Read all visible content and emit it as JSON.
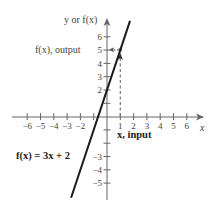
{
  "chart_data": {
    "type": "line",
    "title": "",
    "function_label": "f(x) = 3x + 2",
    "xlabel": "x",
    "ylabel": "y or f(x)",
    "x_annotation": "x, input",
    "y_annotation": "f(x), output",
    "x_ticks": [
      -6,
      -5,
      -4,
      -3,
      -2,
      1,
      2,
      3,
      4,
      5,
      6
    ],
    "x_tick_labels": [
      "−6",
      "−5",
      "−4",
      "−3",
      "−2",
      "1",
      "2",
      "3",
      "4",
      "5",
      "6"
    ],
    "y_ticks": [
      6,
      5,
      4,
      3,
      2,
      -3,
      -4,
      -5
    ],
    "y_tick_labels": [
      "6",
      "5",
      "4",
      "3",
      "2",
      "−3",
      "−4",
      "−5"
    ],
    "xlim": [
      -7,
      7
    ],
    "ylim": [
      -6,
      7
    ],
    "series": [
      {
        "name": "f(x) = 3x + 2",
        "slope": 3,
        "intercept": 2,
        "x": [
          -2.7,
          1.73
        ],
        "y": [
          -6.1,
          7.2
        ]
      }
    ],
    "highlight_point": {
      "x": 1,
      "y": 5
    },
    "grid": false,
    "legend": "none",
    "colors": {
      "axis": "#555555",
      "line": "#1a1a1a",
      "dashed": "#777777"
    }
  }
}
